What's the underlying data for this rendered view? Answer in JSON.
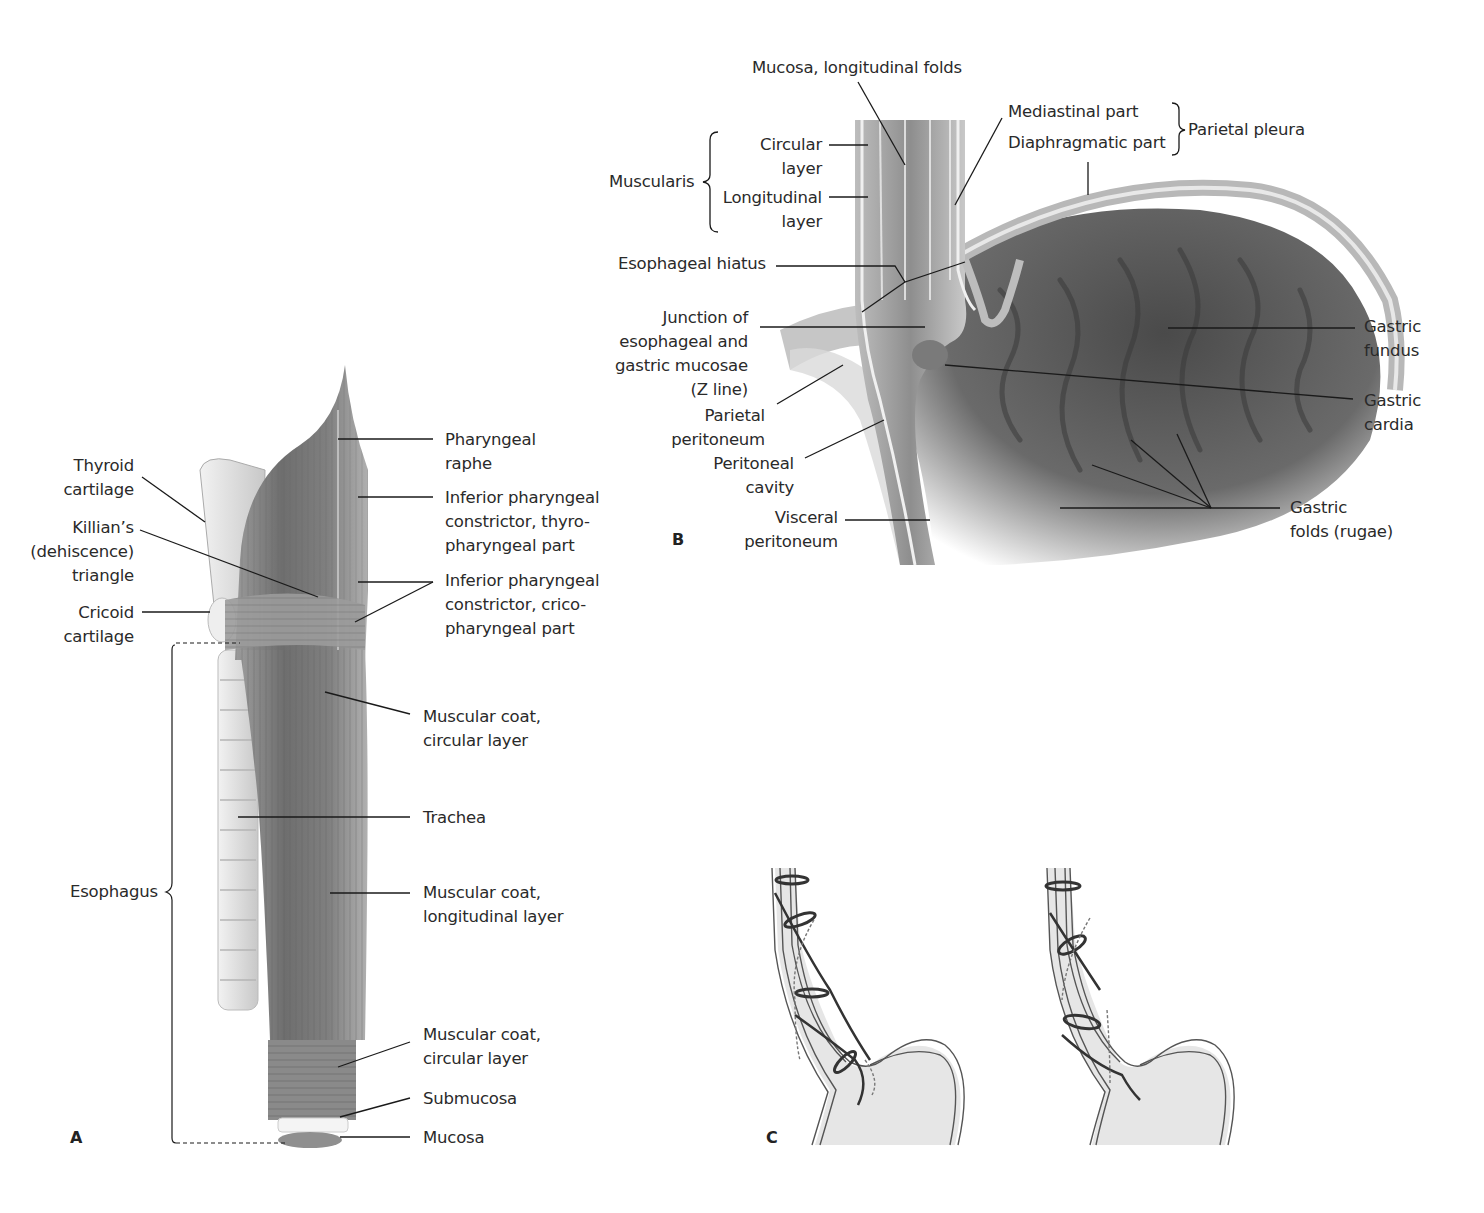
{
  "figure": {
    "panels": [
      {
        "id": "A",
        "letter": "A"
      },
      {
        "id": "B",
        "letter": "B"
      },
      {
        "id": "C",
        "letter": "C"
      }
    ],
    "panelA": {
      "left_labels": [
        {
          "key": "thyroid",
          "text": "Thyroid\ncartilage"
        },
        {
          "key": "killian",
          "text": "Killian’s\n(dehiscence)\ntriangle"
        },
        {
          "key": "cricoid",
          "text": "Cricoid\ncartilage"
        },
        {
          "key": "esophagus",
          "text": "Esophagus"
        }
      ],
      "right_labels": [
        {
          "key": "raphe",
          "text": "Pharyngeal\nraphe"
        },
        {
          "key": "thyropharyngeal",
          "text": "Inferior pharyngeal\nconstrictor, thyro-\npharyngeal part"
        },
        {
          "key": "cricopharyngeal",
          "text": "Inferior pharyngeal\nconstrictor, crico-\npharyngeal part"
        },
        {
          "key": "circular_upper",
          "text": "Muscular coat,\ncircular layer"
        },
        {
          "key": "trachea",
          "text": "Trachea"
        },
        {
          "key": "longitudinal",
          "text": "Muscular coat,\nlongitudinal layer"
        },
        {
          "key": "circular_lower",
          "text": "Muscular coat,\ncircular layer"
        },
        {
          "key": "submucosa",
          "text": "Submucosa"
        },
        {
          "key": "mucosa",
          "text": "Mucosa"
        }
      ]
    },
    "panelB": {
      "top_label": "Mucosa, longitudinal folds",
      "muscularis": "Muscularis",
      "circular_layer": "Circular\nlayer",
      "longitudinal_layer": "Longitudinal\nlayer",
      "mediastinal_part": "Mediastinal part",
      "diaphragmatic_part": "Diaphragmatic part",
      "parietal_pleura": "Parietal pleura",
      "esophageal_hiatus": "Esophageal hiatus",
      "z_line": "Junction of\nesophageal and\ngastric mucosae\n(Z line)",
      "parietal_peritoneum": "Parietal\nperitoneum",
      "peritoneal_cavity": "Peritoneal\ncavity",
      "visceral_peritoneum": "Visceral\nperitoneum",
      "gastric_fundus": "Gastric\nfundus",
      "gastric_cardia": "Gastric\ncardia",
      "gastric_folds": "Gastric\nfolds (rugae)"
    },
    "colors": {
      "line": "#1a1a1a",
      "tissue_dark": "#5a5a5a",
      "tissue_mid": "#8a8a8a",
      "tissue_light": "#d8d8d8",
      "schematic_fill": "#e6e6e6"
    }
  }
}
